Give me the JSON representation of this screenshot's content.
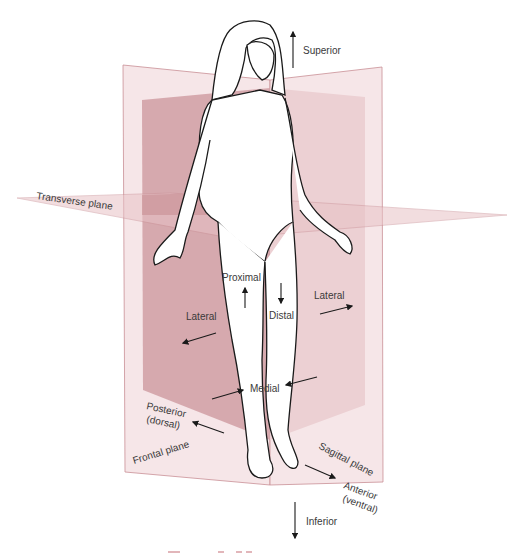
{
  "diagram": {
    "type": "anatomical-planes-and-directional-terms",
    "colors": {
      "plane_outline": "#c98f95",
      "plane_light": "#f3dfe1",
      "plane_mid": "#e8c2c6",
      "plane_dark": "#c98f95",
      "figure_outline": "#1a1a1a",
      "text": "#3a3a3a",
      "caption": "#c0555d"
    },
    "planes": {
      "transverse": "Transverse plane",
      "frontal": "Frontal plane",
      "sagittal": "Sagittal plane"
    },
    "directions": {
      "superior": "Superior",
      "inferior": "Inferior",
      "proximal": "Proximal",
      "distal": "Distal",
      "lateral_left": "Lateral",
      "lateral_right": "Lateral",
      "medial": "Medial",
      "posterior_line1": "Posterior",
      "posterior_line2": "(dorsal)",
      "anterior_line1": "Anterior",
      "anterior_line2": "(ventral)"
    }
  }
}
